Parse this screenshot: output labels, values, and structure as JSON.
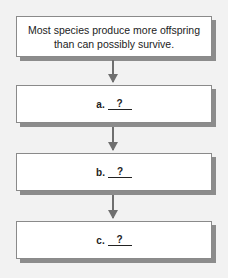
{
  "diagram": {
    "type": "flowchart",
    "background": "#f2f2f2",
    "start": {
      "text": "Most species produce more offspring than can possibly survive."
    },
    "steps": [
      {
        "letter": "a.",
        "blank": "?"
      },
      {
        "letter": "b.",
        "blank": "?"
      },
      {
        "letter": "c.",
        "blank": "?"
      }
    ],
    "connector": "down-arrow"
  }
}
